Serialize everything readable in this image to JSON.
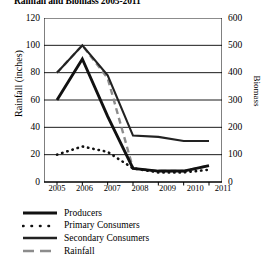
{
  "chart_data": {
    "type": "line",
    "title": "Rainfall and Biomass 2005-2011",
    "xlabel": "",
    "ylabel": "Rainfall (inches)",
    "y2label": "Biomass",
    "x": [
      2005,
      2006,
      2007,
      2008,
      2009,
      2010,
      2011
    ],
    "xtick_labels": [
      "2005",
      "2006",
      "2007",
      "2008",
      "2009",
      "2010",
      "2011"
    ],
    "ylim": [
      0,
      120
    ],
    "ytick_labels": [
      "0",
      "20",
      "40",
      "60",
      "80",
      "100",
      "120"
    ],
    "ytick_values": [
      0,
      20,
      40,
      60,
      80,
      100,
      120
    ],
    "y2lim": [
      0,
      600
    ],
    "y2tick_labels": [
      "0",
      "100",
      "200",
      "300",
      "400",
      "500",
      "600"
    ],
    "y2tick_values": [
      0,
      100,
      200,
      300,
      400,
      500,
      600
    ],
    "grid": true,
    "legend_position": "below",
    "series": [
      {
        "name": "Producers",
        "axis": "right",
        "style": "solid-thick",
        "color": "#111111",
        "values_left_scale": [
          60,
          90,
          48,
          10,
          8,
          8,
          12
        ],
        "values": [
          300,
          450,
          240,
          50,
          40,
          40,
          60
        ]
      },
      {
        "name": "Primary Consumers",
        "axis": "right",
        "style": "dotted",
        "color": "#111111",
        "values_left_scale": [
          20,
          26,
          22,
          10,
          7,
          7,
          9
        ],
        "values": [
          100,
          130,
          110,
          50,
          35,
          35,
          45
        ]
      },
      {
        "name": "Secondary Consumers",
        "axis": "right",
        "style": "solid",
        "color": "#222222",
        "values_left_scale": [
          80,
          100,
          78,
          34,
          33,
          30,
          30
        ],
        "values": [
          400,
          500,
          390,
          170,
          165,
          150,
          150
        ]
      },
      {
        "name": "Rainfall",
        "axis": "left",
        "style": "dashed",
        "color": "#8c8c8c",
        "values": [
          80,
          100,
          76,
          10,
          8,
          8,
          12
        ],
        "values_left_scale": [
          80,
          100,
          76,
          10,
          8,
          8,
          12
        ]
      }
    ]
  }
}
